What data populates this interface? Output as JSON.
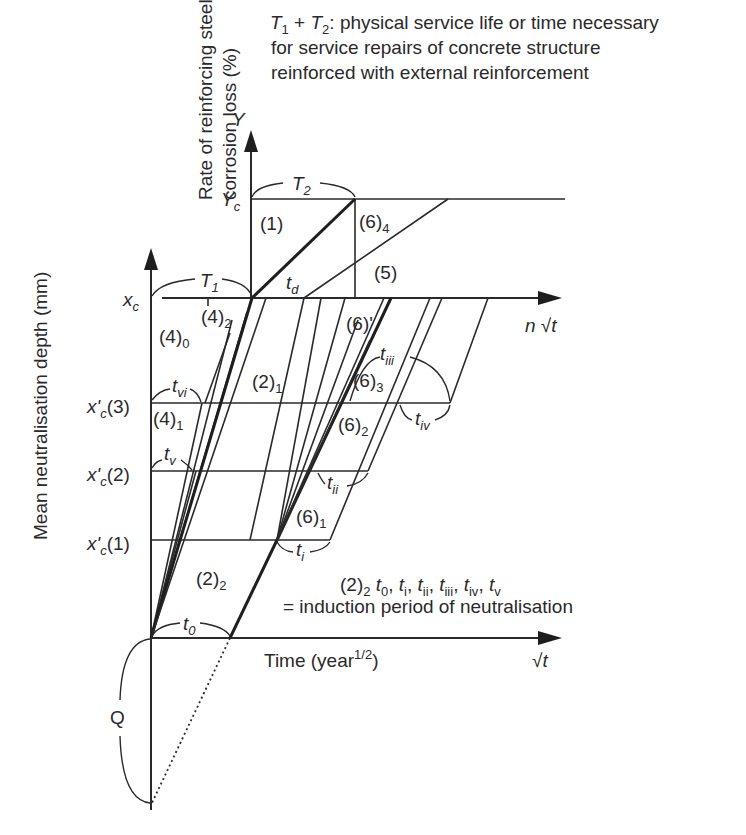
{
  "figure": {
    "note_title": [
      "T₁ + T₂: physical service life or time necessary",
      "for service repairs of concrete structure",
      "reinforced with external reinforcement"
    ],
    "note_title_parts": {
      "t1": "T",
      "t1_sub": "1",
      "plus": " + ",
      "t2": "T",
      "t2_sub": "2",
      "line1_rest": ": physical service life or time necessary",
      "line2": "for service repairs of concrete structure",
      "line3": "reinforced with external reinforcement"
    },
    "y_axis_upper_label_line1": "Rate of reinforcing steel",
    "y_axis_upper_label_line2": "corrosion loss (%)",
    "y_axis_lower_label": "Mean neutralisation depth (mm)",
    "x_axis_label": "Time (year",
    "x_axis_label_sup": "1/2",
    "x_axis_label_close": ")",
    "x_axis_symbol": "√t",
    "upper_x_axis_symbol_n": "n",
    "upper_x_axis_symbol": "√t",
    "y_symbol": "Y",
    "yc_symbol": "Y",
    "yc_sub": "c",
    "xc_symbol": "x",
    "xc_sub": "c",
    "xprime_levels": [
      {
        "sym": "x'",
        "sub": "c",
        "idx": "(3)"
      },
      {
        "sym": "x'",
        "sub": "c",
        "idx": "(2)"
      },
      {
        "sym": "x'",
        "sub": "c",
        "idx": "(1)"
      }
    ],
    "region_labels": {
      "r1": "(1)",
      "r5": "(5)",
      "r6_4": "(6)",
      "r6_4_sub": "4",
      "r6p": "(6)'",
      "r6_3": "(6)",
      "r6_3_sub": "3",
      "r6_2": "(6)",
      "r6_2_sub": "2",
      "r6_1": "(6)",
      "r6_1_sub": "1",
      "r4_0": "(4)",
      "r4_0_sub": "0",
      "r4_1": "(4)",
      "r4_1_sub": "1",
      "r4_2": "(4)",
      "r4_2_sub": "2",
      "r2_1": "(2)",
      "r2_1_sub": "1",
      "r2_2": "(2)",
      "r2_2_sub": "2"
    },
    "time_labels": {
      "T1": "T",
      "T1_sub": "1",
      "T2": "T",
      "T2_sub": "2",
      "td": "t",
      "td_sub": "d",
      "t0": "t",
      "t0_sub": "0",
      "ti": "t",
      "ti_sub": "i",
      "tii": "t",
      "tii_sub": "ii",
      "tiii": "t",
      "tiii_sub": "iii",
      "tiv": "t",
      "tiv_sub": "iv",
      "tv": "t",
      "tv_sub": "v",
      "tvi": "t",
      "tvi_sub": "vi",
      "Q": "Q"
    },
    "induction_note": {
      "prefix": "(2)",
      "prefix_sub": "2",
      "list": [
        {
          "t": "t",
          "s": "0"
        },
        {
          "t": "t",
          "s": "i"
        },
        {
          "t": "t",
          "s": "ii"
        },
        {
          "t": "t",
          "s": "iii"
        },
        {
          "t": "t",
          "s": "iv"
        },
        {
          "t": "t",
          "s": "v"
        }
      ],
      "line2": "= induction period of neutralisation"
    }
  }
}
